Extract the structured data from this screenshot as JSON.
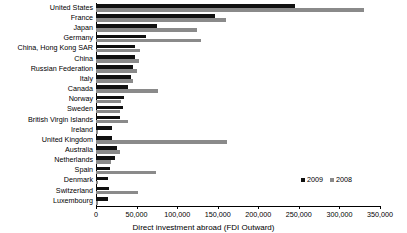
{
  "chart_data": {
    "type": "bar",
    "orientation": "horizontal",
    "title": "",
    "xlabel": "Direct investment abroad (FDI Outward)",
    "ylabel": "",
    "xlim": [
      0,
      350000
    ],
    "xticks": [
      0,
      50000,
      100000,
      150000,
      200000,
      250000,
      300000,
      350000
    ],
    "xticklabels": [
      "0",
      "50,000",
      "100,000",
      "150,000",
      "200,000",
      "250,000",
      "300,000",
      "350,000"
    ],
    "grid": false,
    "legend_position": "lower right",
    "categories": [
      "United States",
      "France",
      "Japan",
      "Germany",
      "China, Hong Kong SAR",
      "China",
      "Russian Federation",
      "Italy",
      "Canada",
      "Norway",
      "Sweden",
      "British Virgin Islands",
      "Ireland",
      "United Kingdom",
      "Australia",
      "Netherlands",
      "Spain",
      "Denmark",
      "Switzerland",
      "Luxembourg"
    ],
    "series": [
      {
        "name": "2009",
        "color": "#111111",
        "values": [
          245000,
          147000,
          75000,
          62000,
          48000,
          48000,
          46000,
          43000,
          40000,
          35000,
          33000,
          30000,
          20000,
          20000,
          26000,
          24000,
          17000,
          15000,
          16000,
          15000
        ]
      },
      {
        "name": "2008",
        "color": "#8a8a8a",
        "values": [
          330000,
          160000,
          125000,
          130000,
          54000,
          53000,
          50000,
          45000,
          77000,
          31000,
          29000,
          40000,
          2000,
          161000,
          30000,
          19000,
          74000,
          3000,
          52000,
          3000
        ]
      }
    ]
  },
  "legend": {
    "items": [
      {
        "label": "2009",
        "color": "#111111"
      },
      {
        "label": "2008",
        "color": "#8a8a8a"
      }
    ]
  }
}
